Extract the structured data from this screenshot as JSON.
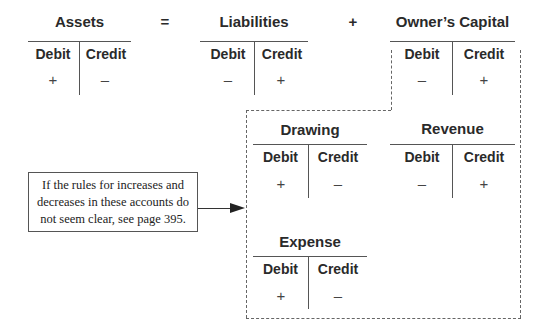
{
  "equation": {
    "equals": "=",
    "plus": "+"
  },
  "accounts": {
    "assets": {
      "title": "Assets",
      "debit_label": "Debit",
      "credit_label": "Credit",
      "debit_sign": "+",
      "credit_sign": "–"
    },
    "liabilities": {
      "title": "Liabilities",
      "debit_label": "Debit",
      "credit_label": "Credit",
      "debit_sign": "–",
      "credit_sign": "+"
    },
    "owners_capital": {
      "title": "Owner’s Capital",
      "debit_label": "Debit",
      "credit_label": "Credit",
      "debit_sign": "–",
      "credit_sign": "+"
    },
    "drawing": {
      "title": "Drawing",
      "debit_label": "Debit",
      "credit_label": "Credit",
      "debit_sign": "+",
      "credit_sign": "–"
    },
    "revenue": {
      "title": "Revenue",
      "debit_label": "Debit",
      "credit_label": "Credit",
      "debit_sign": "–",
      "credit_sign": "+"
    },
    "expense": {
      "title": "Expense",
      "debit_label": "Debit",
      "credit_label": "Credit",
      "debit_sign": "+",
      "credit_sign": "–"
    }
  },
  "note": {
    "line1": "If the rules for increases and",
    "line2": "decreases in these accounts do",
    "line3": "not seem clear, see page 395."
  }
}
